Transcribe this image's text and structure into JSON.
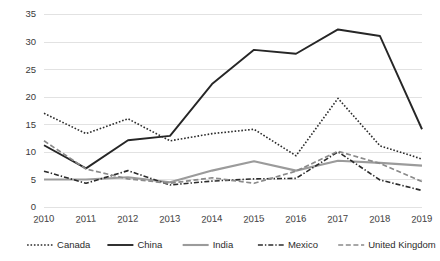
{
  "chart_data": {
    "type": "line",
    "title": "",
    "subtitle": "",
    "xlabel": "",
    "ylabel": "",
    "categories": [
      "2010",
      "2011",
      "2012",
      "2013",
      "2014",
      "2015",
      "2016",
      "2017",
      "2018",
      "2019"
    ],
    "x": [
      2010,
      2011,
      2012,
      2013,
      2014,
      2015,
      2016,
      2017,
      2018,
      2019
    ],
    "ylim": [
      0,
      35
    ],
    "xlim": [
      2010,
      2019
    ],
    "yticks": [
      0,
      5,
      10,
      15,
      20,
      25,
      30,
      35
    ],
    "ytick_labels": [
      "0",
      "5",
      "10",
      "15",
      "20",
      "25",
      "30",
      "35"
    ],
    "grid": true,
    "grid_axis": "y",
    "legend_position": "bottom",
    "series": [
      {
        "name": "Canada",
        "style": "dotted",
        "color": "#2b2b2b",
        "width": 1.6,
        "dasharray": "1.6,1.8",
        "values": [
          17.0,
          13.3,
          16.0,
          12.0,
          13.3,
          14.1,
          9.3,
          19.7,
          11.1,
          8.7
        ]
      },
      {
        "name": "China",
        "style": "solid",
        "color": "#262626",
        "width": 1.9,
        "dasharray": "none",
        "values": [
          11.2,
          7.0,
          12.1,
          12.9,
          22.3,
          28.5,
          27.8,
          32.2,
          31.0,
          14.1
        ]
      },
      {
        "name": "India",
        "style": "solid",
        "color": "#9b9b9b",
        "width": 2.1,
        "dasharray": "none",
        "values": [
          5.0,
          5.0,
          5.4,
          4.5,
          6.6,
          8.3,
          6.6,
          8.4,
          8.0,
          7.5
        ]
      },
      {
        "name": "Mexico",
        "style": "dash-dot",
        "color": "#2b2b2b",
        "width": 1.6,
        "dasharray": "5,2,1.4,2",
        "values": [
          6.5,
          4.3,
          6.6,
          4.0,
          4.7,
          5.1,
          5.2,
          10.0,
          4.9,
          3.0
        ]
      },
      {
        "name": "United Kingdom",
        "style": "dashed",
        "color": "#8a8a8a",
        "width": 1.7,
        "dasharray": "5,2.6",
        "values": [
          12.0,
          6.9,
          5.1,
          4.3,
          5.3,
          4.3,
          6.5,
          10.1,
          7.9,
          4.6
        ]
      }
    ]
  },
  "legend": {
    "items": [
      {
        "label": "Canada"
      },
      {
        "label": "China"
      },
      {
        "label": "India"
      },
      {
        "label": "Mexico"
      },
      {
        "label": "United Kingdom"
      }
    ]
  },
  "colors": {
    "background": "#ffffff",
    "gridline": "#e2e2e2",
    "tick_text": "#3a3a3a",
    "legend_text": "#2b2b2b"
  }
}
